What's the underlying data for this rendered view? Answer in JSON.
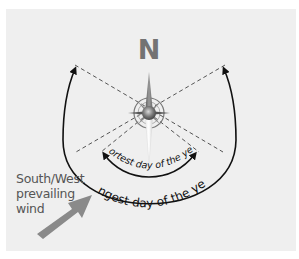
{
  "diagram": {
    "north_label": "N",
    "shortest_day_label": "Shortest day of the year",
    "longest_day_label": "Longest day of the year",
    "wind_label": [
      "South/West",
      "prevailing",
      "wind"
    ]
  },
  "colors": {
    "panel_bg": "#efefef",
    "north_text": "#737373",
    "arc_stroke": "#111111",
    "dashed_line": "#555555",
    "wind_arrow": "#8a8a8a",
    "wind_text": "#555555"
  }
}
